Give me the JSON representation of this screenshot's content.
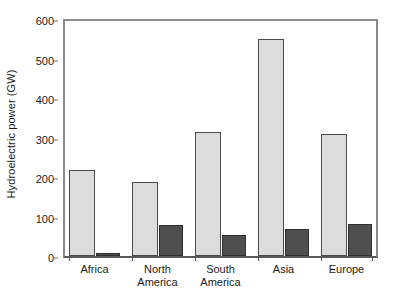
{
  "chart_data": {
    "type": "bar",
    "title": "",
    "subtitle": "",
    "xlabel": "",
    "ylabel": "Hydroelectric power (GW)",
    "ylim": [
      0,
      600
    ],
    "yticks": [
      0,
      100,
      200,
      300,
      400,
      500,
      600
    ],
    "ytick_labels": [
      "0",
      "100",
      "200",
      "300",
      "400",
      "500",
      "600"
    ],
    "grid": false,
    "legend": "none",
    "categories": [
      "Africa",
      "North America",
      "South America",
      "Asia",
      "Europe"
    ],
    "category_lines": [
      [
        "Africa"
      ],
      [
        "North",
        "America"
      ],
      [
        "South",
        "America"
      ],
      [
        "Asia"
      ],
      [
        "Europe"
      ]
    ],
    "series": [
      {
        "name": "series-1-light",
        "color": "#dcdcdc",
        "edge_color": "#4a4a4a",
        "values": [
          219,
          188,
          315,
          550,
          308
        ]
      },
      {
        "name": "series-2-dark",
        "color": "#4f4f4f",
        "edge_color": "#2e2e2e",
        "values": [
          8,
          79,
          54,
          69,
          81
        ]
      }
    ]
  },
  "style": {
    "frame_color": "#8a8a8a",
    "axis_color": "#5a5a5a",
    "text_color": "#1a1a1a",
    "background": "#ffffff"
  }
}
